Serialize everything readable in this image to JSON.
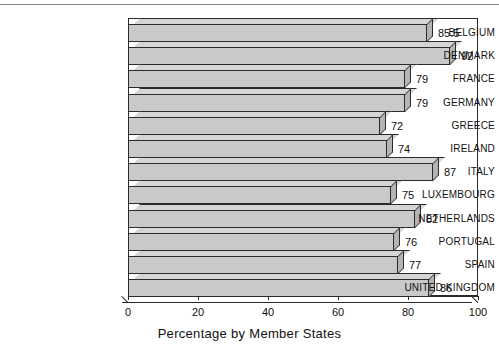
{
  "chart_data": {
    "type": "bar",
    "orientation": "horizontal",
    "title": "",
    "xlabel": "Percentage by Member States",
    "ylabel": "",
    "xlim": [
      0,
      100
    ],
    "xticks": [
      0,
      20,
      40,
      60,
      80,
      100
    ],
    "xtick_labels": [
      "0",
      "20",
      "40",
      "60",
      "80",
      "100"
    ],
    "grid": false,
    "legend": "none",
    "categories": [
      "BELGIUM",
      "DENMARK",
      "FRANCE",
      "GERMANY",
      "GREECE",
      "IRELAND",
      "ITALY",
      "LUXEMBOURG",
      "NETHERLANDS",
      "PORTUGAL",
      "SPAIN",
      "UNITED KINGDOM"
    ],
    "values": [
      85.5,
      92,
      79,
      79,
      72,
      74,
      87,
      75,
      82,
      76,
      77,
      86
    ],
    "value_labels": [
      "85.5",
      "92",
      "79",
      "79",
      "72",
      "74",
      "87",
      "75",
      "82",
      "76",
      "77",
      "86"
    ],
    "colors": {
      "bar_face": "#c9c9c9",
      "bar_top": "#d5d5d5",
      "bar_side": "#b4b4b4",
      "outline": "#2b2b2b",
      "background": "#ffffff",
      "text": "#111111"
    }
  }
}
